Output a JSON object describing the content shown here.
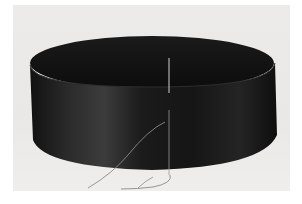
{
  "image": {
    "description": "Black satin ribbon formed into a loop with a sewing needle and grey thread on a light grey background",
    "colors": {
      "background": "#ebeae8",
      "ribbon": "#161616",
      "ribbon_highlight": "#3a3a3a",
      "thread": "#8c8a86",
      "needle": "#c9c9c9"
    }
  }
}
